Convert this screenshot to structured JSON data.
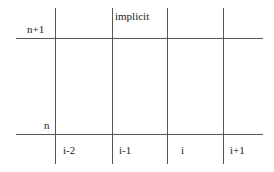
{
  "diagram": {
    "title_label": "implicit",
    "row_labels": {
      "upper": "n+1",
      "lower": "n"
    },
    "column_labels": [
      "i-2",
      "i-1",
      "i",
      "i+1"
    ],
    "colors": {
      "line": "#555555",
      "text": "#222222",
      "background": "#ffffff"
    }
  }
}
